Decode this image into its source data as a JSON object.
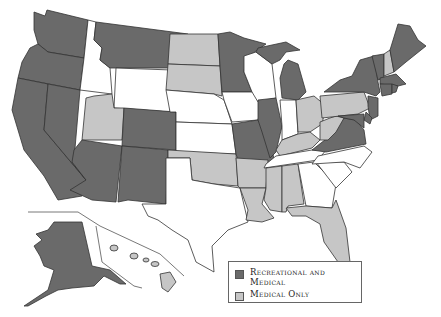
{
  "map": {
    "title": "US states cannabis legalization map",
    "colors": {
      "recreational_and_medical": "#6a6a6a",
      "medical_only": "#c6c6c6",
      "none": "#ffffff",
      "border": "#333333"
    },
    "states": {
      "recreational_and_medical": [
        "WA",
        "OR",
        "CA",
        "NV",
        "MT",
        "AZ",
        "CO",
        "NM",
        "MN",
        "MO",
        "IL",
        "MI",
        "VA",
        "NY",
        "VT",
        "ME",
        "MA",
        "CT",
        "RI",
        "NJ",
        "DE",
        "MD",
        "AK"
      ],
      "medical_only": [
        "UT",
        "ND",
        "SD",
        "OK",
        "AR",
        "LA",
        "MS",
        "AL",
        "FL",
        "OH",
        "WV",
        "KY",
        "PA",
        "NH",
        "HI"
      ],
      "none": [
        "ID",
        "WY",
        "NE",
        "KS",
        "TX",
        "IA",
        "WI",
        "IN",
        "TN",
        "NC",
        "SC",
        "GA"
      ]
    }
  },
  "legend": {
    "items": [
      {
        "label": "Recreational and Medical",
        "color": "#6a6a6a"
      },
      {
        "label": "Medical Only",
        "color": "#c6c6c6"
      }
    ]
  }
}
